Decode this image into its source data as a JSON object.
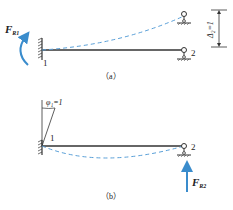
{
  "diagram": {
    "colors": {
      "beam": "#333333",
      "deflection": "#5aa0d8",
      "force": "#3a8ccc",
      "text": "#222222"
    },
    "panel_a": {
      "caption": "（a）",
      "node1_label": "1",
      "node2_label": "2",
      "reaction_label_main": "F",
      "reaction_label_sub": "R1",
      "displacement_label": "Δ₂=1"
    },
    "panel_b": {
      "caption": "（b）",
      "node1_label": "1",
      "node2_label": "2",
      "rotation_label": "φ₁=1",
      "reaction_label_main": "F",
      "reaction_label_sub": "R2"
    }
  }
}
